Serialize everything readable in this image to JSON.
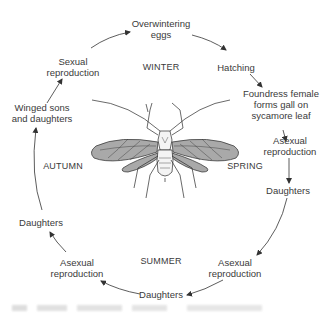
{
  "diagram": {
    "type": "life-cycle",
    "stages": [
      {
        "id": "overwintering-eggs",
        "lines": [
          "Overwintering",
          "eggs"
        ]
      },
      {
        "id": "hatching",
        "lines": [
          "Hatching"
        ]
      },
      {
        "id": "foundress",
        "lines": [
          "Foundress female",
          "forms gall on",
          "sycamore leaf"
        ]
      },
      {
        "id": "asexual-spring",
        "lines": [
          "Asexual",
          "reproduction"
        ]
      },
      {
        "id": "daughters-spring",
        "lines": [
          "Daughters"
        ]
      },
      {
        "id": "asexual-summer-right",
        "lines": [
          "Asexual",
          "reproduction"
        ]
      },
      {
        "id": "daughters-summer",
        "lines": [
          "Daughters"
        ]
      },
      {
        "id": "asexual-summer-left",
        "lines": [
          "Asexual",
          "reproduction"
        ]
      },
      {
        "id": "daughters-autumn",
        "lines": [
          "Daughters"
        ]
      },
      {
        "id": "winged-sons-daughters",
        "lines": [
          "Winged sons",
          "and daughters"
        ]
      },
      {
        "id": "sexual-reproduction",
        "lines": [
          "Sexual",
          "reproduction"
        ]
      }
    ],
    "seasons": {
      "winter": "WINTER",
      "spring": "SPRING",
      "summer": "SUMMER",
      "autumn": "AUTUMN"
    },
    "colors": {
      "text": "#3a3a3a",
      "arrow": "#333333",
      "wing_fill": "#a9a9a9",
      "body_fill": "#f4f4f4",
      "outline": "#2a2a2a"
    }
  }
}
